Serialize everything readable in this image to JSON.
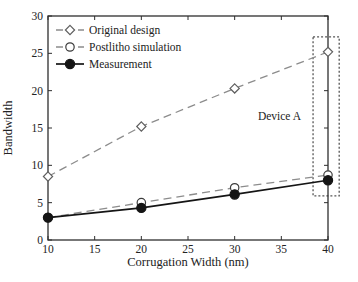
{
  "figure": {
    "background": "#ffffff"
  },
  "chart_data": {
    "type": "line",
    "title": "",
    "xlabel": "Corrugation Width (nm)",
    "ylabel": "Bandwidth",
    "xlim": [
      10,
      40
    ],
    "ylim": [
      0,
      30
    ],
    "xticks": [
      10,
      15,
      20,
      25,
      30,
      35,
      40
    ],
    "yticks": [
      0,
      5,
      10,
      15,
      20,
      25,
      30
    ],
    "grid": false,
    "legend_position": "top-left",
    "x": [
      10,
      20,
      30,
      40
    ],
    "series": [
      {
        "name": "Original design",
        "marker": "diamond",
        "marker_fill": "open",
        "line_style": "dashed",
        "line_color": "#8c8c8c",
        "marker_color": "#5f5f5f",
        "values": [
          8.5,
          15.2,
          20.3,
          25.2
        ]
      },
      {
        "name": "Postlitho simulation",
        "marker": "circle",
        "marker_fill": "open",
        "line_style": "dashed",
        "line_color": "#8c8c8c",
        "marker_color": "#3c3c3c",
        "values": [
          3.0,
          5.0,
          7.0,
          8.7
        ]
      },
      {
        "name": "Measurement",
        "marker": "circle",
        "marker_fill": "filled",
        "line_style": "solid",
        "line_color": "#151515",
        "marker_color": "#151515",
        "values": [
          3.0,
          4.3,
          6.1,
          8.0
        ]
      }
    ],
    "annotations": [
      {
        "text": "Device A",
        "x": 34.8,
        "y": 16.6
      }
    ],
    "highlight_box": {
      "x0": 38.4,
      "x1": 41.2,
      "y0": 5.9,
      "y1": 27.2,
      "style": "dotted",
      "color": "#555555"
    },
    "axis_color": "#2e2e2e",
    "text_color": "#222222"
  }
}
